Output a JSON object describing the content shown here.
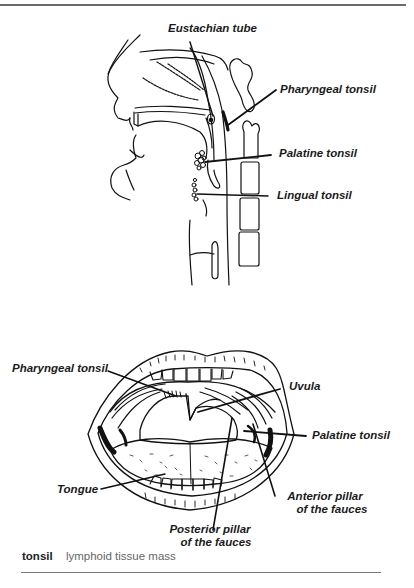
{
  "figure_sagittal": {
    "labels": {
      "eustachian_tube": "Eustachian tube",
      "pharyngeal_tonsil": "Pharyngeal tonsil",
      "palatine_tonsil": "Palatine tonsil",
      "lingual_tonsil": "Lingual tonsil"
    }
  },
  "figure_mouth": {
    "labels": {
      "pharyngeal_tonsil": "Pharyngeal tonsil",
      "uvula": "Uvula",
      "palatine_tonsil": "Palatine tonsil",
      "tongue": "Tongue",
      "anterior_pillar_line1": "Anterior pillar",
      "anterior_pillar_line2": "of the fauces",
      "posterior_pillar_line1": "Posterior pillar",
      "posterior_pillar_line2": "of the fauces"
    }
  },
  "definition": {
    "term": "tonsil",
    "meaning": "lymphoid tissue mass"
  }
}
